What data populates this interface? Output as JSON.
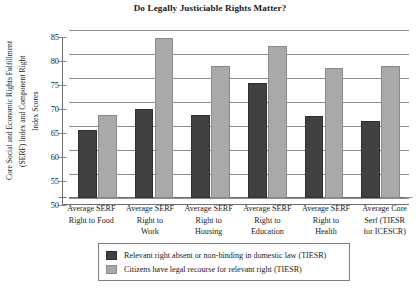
{
  "chart_data": {
    "type": "bar",
    "title": "Do Legally Justiciable Rights Matter?",
    "xlabel": "",
    "ylabel": "Core Social and Economic Rights Fulfillment (SERF) Index and Component Right Index Scores",
    "ylabel_lines": [
      "Core Social and Economic Rights Fulfillment",
      "(SERF) Index and Component Right",
      "Index Scores"
    ],
    "ylim": [
      50,
      85
    ],
    "ytick_labels": [
      "85",
      "80",
      "75",
      "70",
      "65",
      "60",
      "55",
      "50"
    ],
    "ytick_values": [
      85,
      80,
      75,
      70,
      65,
      60,
      55,
      50
    ],
    "grid": true,
    "legend_position": "bottom",
    "categories": [
      "Average SERF Right to Food",
      "Average SERF Right to Work",
      "Average SERF Right to Housing",
      "Average SERF Right to Education",
      "Average SERF Right to Health",
      "Average Core Serf (TIESR for ICESCR)"
    ],
    "category_lines": [
      [
        "Average SERF",
        "Right to Food"
      ],
      [
        "Average SERF",
        "Right to",
        "Work"
      ],
      [
        "Average SERF",
        "Right to",
        "Housing"
      ],
      [
        "Average SERF",
        "Right to",
        "Education"
      ],
      [
        "Average SERF",
        "Right to",
        "Health"
      ],
      [
        "Average Core",
        "Serf (TIESR",
        "for ICESCR)"
      ]
    ],
    "series": [
      {
        "name": "Relevant right absent or non-binding in domestic law (TIESR)",
        "color": "#414141",
        "values": [
          64.2,
          68.6,
          67.2,
          74.0,
          67.0,
          66.1
        ]
      },
      {
        "name": "Citizens have legal recourse for relevant right (TIESR)",
        "color": "#a9a9a9",
        "values": [
          67.2,
          83.4,
          77.4,
          81.6,
          77.0,
          77.4
        ]
      }
    ]
  },
  "legend": {
    "items": [
      {
        "label": "Relevant right absent or non-binding in domestic law (TIESR)",
        "swatch": "s0"
      },
      {
        "label": "Citizens have legal recourse for relevant right (TIESR)",
        "swatch": "s1"
      }
    ]
  }
}
